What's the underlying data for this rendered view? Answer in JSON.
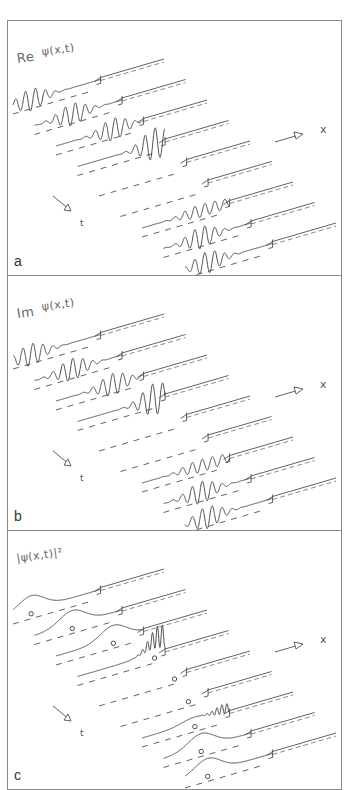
{
  "figure": {
    "panels": [
      {
        "id": "a",
        "letter": "a",
        "prefix": "Re",
        "function": "ψ(x,t)",
        "quantity": "real-part",
        "top": 20,
        "height": 256
      },
      {
        "id": "b",
        "letter": "b",
        "prefix": "Im",
        "function": "ψ(x,t)",
        "quantity": "imag-part",
        "top": 275,
        "height": 256
      },
      {
        "id": "c",
        "letter": "c",
        "prefix": "",
        "function": "|ψ(x,t)|²",
        "quantity": "density",
        "top": 530,
        "height": 260
      }
    ],
    "axes": {
      "x_label": "x",
      "t_label": "t"
    },
    "colors": {
      "frame": "#8a8a8a",
      "curve": "#3a3a3a",
      "label": "#666666"
    }
  },
  "chart_data": {
    "type": "line",
    "xlabel": "x",
    "tlabel": "t",
    "series_count_per_panel": 9,
    "panels": [
      "Re ψ(x,t)",
      "Im ψ(x,t)",
      "|ψ(x,t)|²"
    ]
  }
}
